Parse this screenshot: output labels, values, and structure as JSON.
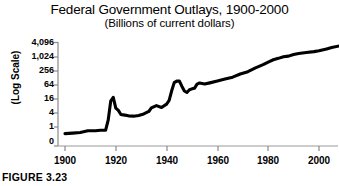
{
  "figure": {
    "caption": "FIGURE 3.23"
  },
  "chart_data": {
    "type": "line",
    "title": "Federal Government Outlays, 1900-2000",
    "subtitle": "(Billions of current dollars)",
    "xlabel": "",
    "ylabel": "(Log Scale)",
    "scale": "log",
    "grid": false,
    "legend": false,
    "xlim": [
      1900,
      2008
    ],
    "ylim": [
      0.35,
      4096
    ],
    "xticks": [
      "1900",
      "1920",
      "1940",
      "1960",
      "1980",
      "2000"
    ],
    "xtick_values": [
      1900,
      1920,
      1940,
      1960,
      1980,
      2000
    ],
    "yticks": [
      "0",
      "1",
      "4",
      "16",
      "64",
      "256",
      "1,024",
      "4,096"
    ],
    "ytick_values": [
      0.35,
      1,
      4,
      16,
      64,
      256,
      1024,
      4096
    ],
    "series": [
      {
        "name": "Federal outlays",
        "x": [
          1900,
          1903,
          1906,
          1909,
          1912,
          1914,
          1916,
          1917,
          1918,
          1919,
          1920,
          1921,
          1922,
          1923,
          1925,
          1927,
          1929,
          1931,
          1933,
          1934,
          1936,
          1938,
          1940,
          1941,
          1942,
          1943,
          1944,
          1945,
          1946,
          1947,
          1948,
          1949,
          1950,
          1951,
          1952,
          1953,
          1955,
          1957,
          1960,
          1963,
          1966,
          1969,
          1972,
          1975,
          1978,
          1980,
          1982,
          1984,
          1986,
          1988,
          1990,
          1992,
          1995,
          1998,
          2000,
          2003,
          2005,
          2008
        ],
        "y": [
          0.52,
          0.55,
          0.58,
          0.69,
          0.69,
          0.73,
          0.73,
          1.95,
          12.7,
          18.5,
          6.4,
          5.1,
          3.4,
          3.3,
          3.0,
          2.9,
          3.1,
          3.6,
          4.6,
          6.5,
          8.2,
          6.8,
          9.5,
          13.7,
          35.1,
          78.6,
          91.3,
          92.7,
          55.2,
          34.5,
          29.8,
          38.8,
          42.6,
          45.5,
          67.7,
          76.1,
          68.4,
          76.6,
          92.2,
          111.3,
          134.5,
          183.6,
          230.7,
          332.3,
          458.7,
          590.9,
          745.7,
          851.8,
          990.4,
          1064.4,
          1253.0,
          1381.5,
          1515.7,
          1652.5,
          1789.0,
          2159.9,
          2472.0,
          2900.0
        ]
      }
    ]
  }
}
